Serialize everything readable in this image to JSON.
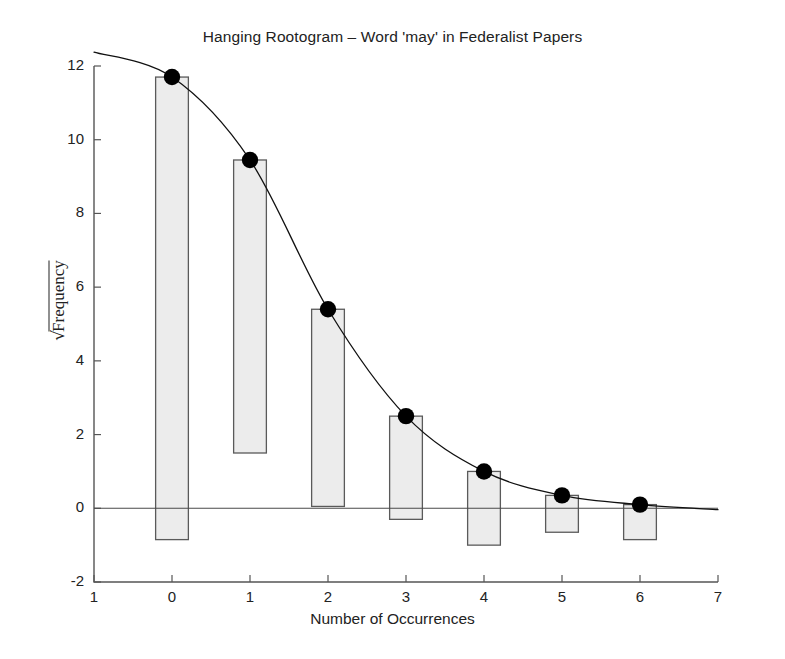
{
  "chart_data": {
    "type": "bar",
    "title": "Hanging Rootogram – Word 'may' in Federalist Papers",
    "xlabel": "Number of Occurrences",
    "ylabel": "√Frequency",
    "ylabel_radical": "√",
    "ylabel_radicand": "Frequency",
    "categories": [
      0,
      1,
      2,
      3,
      4,
      5,
      6
    ],
    "xlim": [
      -1,
      7
    ],
    "ylim": [
      -2,
      12
    ],
    "xticks": [
      -1,
      0,
      1,
      2,
      3,
      4,
      5,
      6,
      7
    ],
    "xticklabels": [
      "1",
      "0",
      "1",
      "2",
      "3",
      "4",
      "5",
      "6",
      "7"
    ],
    "yticks": [
      -2,
      0,
      2,
      4,
      6,
      8,
      10,
      12
    ],
    "yticklabels": [
      "-2",
      "0",
      "2",
      "4",
      "6",
      "8",
      "10",
      "12"
    ],
    "grid": false,
    "legend": "none",
    "series": [
      {
        "name": "Fitted sqrt(expected)",
        "type": "line",
        "marker": "filled-circle",
        "values": [
          11.7,
          9.45,
          5.4,
          2.5,
          1.0,
          0.35,
          0.1
        ]
      },
      {
        "name": "Hanging bar bottom (sqrt fitted - sqrt observed)",
        "type": "bar-bottom",
        "values": [
          -0.85,
          1.5,
          0.05,
          -0.3,
          -1.0,
          -0.65,
          -0.85
        ]
      }
    ],
    "bar_width": 0.42,
    "zero_reference_line": 0,
    "colors": {
      "bar_fill": "#ececec",
      "bar_stroke": "#5a5a5a",
      "curve": "#111111",
      "marker": "#000000",
      "axis": "#555555",
      "text": "#222222",
      "background": "#ffffff"
    }
  }
}
